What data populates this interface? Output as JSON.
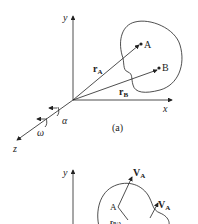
{
  "panel_a": {
    "caption": "(a)",
    "axis_x": "x",
    "axis_y": "y",
    "axis_z": "z",
    "point_A": "A",
    "point_B": "B",
    "vector_rA": {
      "main": "r",
      "sub": "A"
    },
    "vector_rB": {
      "main": "r",
      "sub": "B"
    },
    "angle_alpha": "α",
    "angular_velocity": "ω"
  },
  "panel_b": {
    "axis_y": "y",
    "point_A": "A",
    "velocity_1": {
      "main": "V",
      "sub": "A"
    },
    "velocity_2": {
      "main": "V",
      "sub": "A"
    },
    "vector_partial": {
      "main": "r",
      "sub": "B/A"
    }
  },
  "colors": {
    "line": "#222222",
    "background": "#ffffff"
  }
}
